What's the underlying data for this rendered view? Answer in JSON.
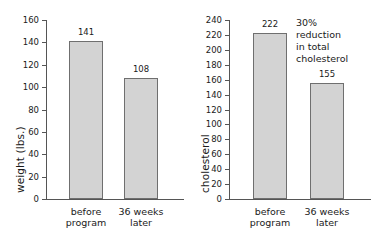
{
  "figure": {
    "background": "#ffffff",
    "bar_fill": "#d3d3d3",
    "bar_stroke": "#6f6f6f",
    "axis_color": "#555555",
    "text_color": "#1a1a1a"
  },
  "chart_data": [
    {
      "type": "bar",
      "title": "",
      "xlabel": "",
      "ylabel": "weight (lbs.)",
      "categories": [
        "before\nprogram",
        "36 weeks\nlater"
      ],
      "values": [
        141,
        108
      ],
      "value_labels": [
        "141",
        "108"
      ],
      "ylim": [
        0,
        160
      ],
      "yticks": [
        0,
        20,
        40,
        60,
        80,
        100,
        120,
        140,
        160
      ],
      "ytick_labels": [
        "0",
        "20",
        "40",
        "60",
        "80",
        "100",
        "120",
        "140",
        "160"
      ],
      "grid": false,
      "legend": "none",
      "annotations": []
    },
    {
      "type": "bar",
      "title": "",
      "xlabel": "",
      "ylabel": "cholesterol",
      "categories": [
        "before\nprogram",
        "36 weeks\nlater"
      ],
      "values": [
        222,
        155
      ],
      "value_labels": [
        "222",
        "155"
      ],
      "ylim": [
        0,
        240
      ],
      "yticks": [
        0,
        20,
        40,
        60,
        80,
        100,
        120,
        140,
        160,
        180,
        200,
        220,
        240
      ],
      "ytick_labels": [
        "0",
        "20",
        "40",
        "60",
        "80",
        "100",
        "120",
        "140",
        "160",
        "180",
        "200",
        "220",
        "240"
      ],
      "grid": false,
      "legend": "none",
      "annotations": [
        {
          "text": "30%\nreduction\nin total\ncholesterol"
        }
      ]
    }
  ]
}
